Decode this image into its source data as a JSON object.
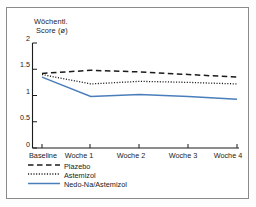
{
  "chart_data": {
    "type": "line",
    "title": "",
    "ylabel": "Wöchentl. Score (ø)",
    "ylabel_line1": "Wöchentl.",
    "ylabel_line2": "Score (ø)",
    "xlabel": "",
    "categories": [
      "Baseline",
      "Woche 1",
      "Woche 2",
      "Woche 3",
      "Woche 4"
    ],
    "ylim": [
      0,
      2
    ],
    "yticks": [
      "0",
      "0.5",
      "1",
      "1.5",
      "2"
    ],
    "ytick_values": [
      0,
      0.5,
      1,
      1.5,
      2
    ],
    "grid": false,
    "legend_position": "below-axes-left",
    "series": [
      {
        "name": "Plazebo",
        "style": "dashed",
        "color": "#1b1b1b",
        "values": [
          1.42,
          1.48,
          1.45,
          1.4,
          1.35
        ]
      },
      {
        "name": "Astemizol",
        "style": "dotted",
        "color": "#1b1b1b",
        "values": [
          1.4,
          1.22,
          1.27,
          1.25,
          1.22
        ]
      },
      {
        "name": "Nedo-Na/Astemizol",
        "style": "solid",
        "color": "#4a7ebb",
        "values": [
          1.35,
          0.98,
          1.02,
          0.98,
          0.93
        ]
      }
    ]
  },
  "frame": {
    "border_color": "#8a8a8a",
    "background": "#ffffff"
  }
}
